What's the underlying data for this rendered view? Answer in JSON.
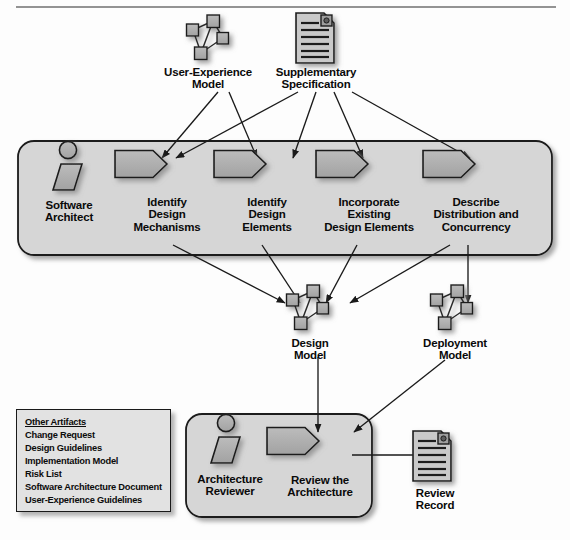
{
  "diagram": {
    "colors": {
      "container_fill": "#d6d6d6",
      "container_stroke": "#1a1a1a",
      "shape_fill": "#b0b0b0",
      "shape_stroke": "#1a1a1a",
      "doc_fill": "#c9c9c9",
      "artifact_box_fill": "#e2e2e2",
      "text": "#0a0a0a",
      "arrow": "#1a1a1a",
      "shadow": "rgba(110,110,110,0.55)"
    },
    "top_rule": {
      "x1": 16,
      "x2": 556,
      "y": 7
    },
    "inputs": [
      {
        "id": "user-experience-model",
        "icon": "node-graph-icon",
        "label": "User-Experience\nModel",
        "x": 208,
        "y": 38,
        "label_x": 150,
        "label_y": 66,
        "label_w": 116
      },
      {
        "id": "supplementary-specification",
        "icon": "document-icon",
        "label": "Supplementary\nSpecification",
        "x": 315,
        "y": 38,
        "label_x": 258,
        "label_y": 66,
        "label_w": 116
      }
    ],
    "containers": [
      {
        "id": "refine-architecture-container",
        "x": 18,
        "y": 141,
        "w": 534,
        "h": 114,
        "r": 16
      },
      {
        "id": "review-architecture-container",
        "x": 186,
        "y": 414,
        "w": 186,
        "h": 103,
        "r": 16
      }
    ],
    "actors": [
      {
        "id": "software-architect",
        "label": "Software\nArchitect",
        "x": 68,
        "y": 167,
        "label_x": 28,
        "label_y": 199,
        "label_w": 82
      },
      {
        "id": "architecture-reviewer",
        "label": "Architecture\nReviewer",
        "x": 226,
        "y": 440,
        "label_x": 184,
        "label_y": 473,
        "label_w": 92
      }
    ],
    "activities": [
      {
        "id": "identify-design-mechanisms",
        "label": "Identify\nDesign\nMechanisms",
        "x": 141,
        "y": 164,
        "w": 52,
        "h": 27,
        "label_x": 106,
        "label_y": 196,
        "label_w": 122
      },
      {
        "id": "identify-design-elements",
        "label": "Identify\nDesign\nElements",
        "x": 240,
        "y": 164,
        "w": 52,
        "h": 27,
        "label_x": 206,
        "label_y": 196,
        "label_w": 122
      },
      {
        "id": "incorporate-existing-design-elements",
        "label": "Incorporate\nExisting\nDesign Elements",
        "x": 342,
        "y": 164,
        "w": 52,
        "h": 27,
        "label_x": 300,
        "label_y": 196,
        "label_w": 138
      },
      {
        "id": "describe-distribution-and-concurrency",
        "label": "Describe\nDistribution and\nConcurrency",
        "x": 449,
        "y": 164,
        "w": 52,
        "h": 27,
        "label_x": 406,
        "label_y": 196,
        "label_w": 140
      },
      {
        "id": "review-the-architecture",
        "label": "Review the\nArchitecture",
        "x": 293,
        "y": 441,
        "w": 52,
        "h": 27,
        "label_x": 265,
        "label_y": 474,
        "label_w": 110
      }
    ],
    "outputs": [
      {
        "id": "design-model",
        "icon": "node-graph-icon",
        "label": "Design\nModel",
        "x": 308,
        "y": 308,
        "label_x": 269,
        "label_y": 337,
        "label_w": 82
      },
      {
        "id": "deployment-model",
        "icon": "node-graph-icon",
        "label": "Deployment\nModel",
        "x": 452,
        "y": 308,
        "label_x": 405,
        "label_y": 337,
        "label_w": 100
      },
      {
        "id": "review-record",
        "icon": "document-icon",
        "label": "Review\nRecord",
        "x": 432,
        "y": 456,
        "label_x": 396,
        "label_y": 487,
        "label_w": 78
      }
    ],
    "other_artifacts": {
      "id": "other-artifacts-box",
      "x": 16,
      "y": 409,
      "w": 155,
      "h": 103,
      "heading": "Other Artifacts",
      "items": [
        "Change Request",
        "Design Guidelines",
        "Implementation Model",
        "Risk List",
        "Software Architecture Document",
        "User-Experience Guidelines"
      ]
    },
    "arrows": [
      {
        "id": "arrow-uxm-to-identify-design-mechanisms",
        "from": "user-experience-model",
        "to": "identify-design-mechanisms",
        "x1": 218,
        "y1": 92,
        "x2": 162,
        "y2": 158
      },
      {
        "id": "arrow-uxm-to-identify-design-elements",
        "from": "user-experience-model",
        "to": "identify-design-elements",
        "x1": 229,
        "y1": 92,
        "x2": 257,
        "y2": 158
      },
      {
        "id": "arrow-supspec-to-identify-design-mechanisms",
        "from": "supplementary-specification",
        "to": "identify-design-mechanisms",
        "x1": 298,
        "y1": 92,
        "x2": 176,
        "y2": 158
      },
      {
        "id": "arrow-supspec-to-incorporate-existing",
        "from": "supplementary-specification",
        "to": "incorporate-existing-design-elements",
        "x1": 316,
        "y1": 92,
        "x2": 293,
        "y2": 158
      },
      {
        "id": "arrow-supspec-to-incorporate",
        "from": "supplementary-specification",
        "to": "incorporate-existing-design-elements",
        "x1": 334,
        "y1": 92,
        "x2": 363,
        "y2": 158
      },
      {
        "id": "arrow-supspec-to-describe-distribution",
        "from": "supplementary-specification",
        "to": "describe-distribution-and-concurrency",
        "x1": 352,
        "y1": 92,
        "x2": 470,
        "y2": 158
      },
      {
        "id": "arrow-identify-mechanisms-to-design-model",
        "from": "identify-design-mechanisms",
        "to": "design-model",
        "x1": 173,
        "y1": 245,
        "x2": 285,
        "y2": 303
      },
      {
        "id": "arrow-identify-elements-to-design-model",
        "from": "identify-design-elements",
        "to": "design-model",
        "x1": 262,
        "y1": 245,
        "x2": 300,
        "y2": 303
      },
      {
        "id": "arrow-incorporate-to-design-model",
        "from": "incorporate-existing-design-elements",
        "to": "design-model",
        "x1": 357,
        "y1": 245,
        "x2": 326,
        "y2": 303
      },
      {
        "id": "arrow-describe-to-design-model",
        "from": "describe-distribution-and-concurrency",
        "to": "design-model",
        "x1": 450,
        "y1": 245,
        "x2": 350,
        "y2": 303
      },
      {
        "id": "arrow-describe-to-deployment-model",
        "from": "describe-distribution-and-concurrency",
        "to": "deployment-model",
        "x1": 468,
        "y1": 245,
        "x2": 468,
        "y2": 303
      },
      {
        "id": "arrow-design-model-to-review",
        "from": "design-model",
        "to": "review-the-architecture",
        "x1": 318,
        "y1": 357,
        "x2": 318,
        "y2": 432
      },
      {
        "id": "arrow-deployment-model-to-review",
        "from": "deployment-model",
        "to": "review-the-architecture",
        "x1": 445,
        "y1": 360,
        "x2": 354,
        "y2": 432
      },
      {
        "id": "arrow-review-to-review-record",
        "from": "review-the-architecture",
        "to": "review-record",
        "x1": 352,
        "y1": 455,
        "x2": 423,
        "y2": 455
      }
    ]
  }
}
